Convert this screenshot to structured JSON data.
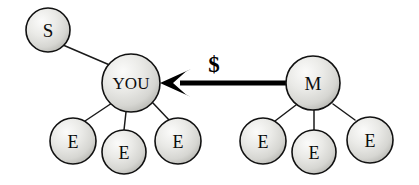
{
  "diagram": {
    "background_color": "#ffffff",
    "node_fill_light": "#f4f4f2",
    "node_fill_mid": "#dcdcd8",
    "node_fill_dark": "#b8b8b4",
    "node_stroke_color": "#111111",
    "edge_color": "#1a1a1a",
    "arrow_color": "#000000",
    "nodes": [
      {
        "id": "s",
        "label": "S",
        "cx": 48,
        "cy": 30,
        "r": 22,
        "font_size": 19
      },
      {
        "id": "you",
        "label": "YOU",
        "cx": 131,
        "cy": 83,
        "r": 29,
        "font_size": 17
      },
      {
        "id": "m",
        "label": "M",
        "cx": 313,
        "cy": 83,
        "r": 27,
        "font_size": 19
      },
      {
        "id": "e1",
        "label": "E",
        "cx": 73,
        "cy": 141,
        "r": 23,
        "font_size": 18
      },
      {
        "id": "e2",
        "label": "E",
        "cx": 124,
        "cy": 152,
        "r": 22,
        "font_size": 18
      },
      {
        "id": "e3",
        "label": "E",
        "cx": 178,
        "cy": 141,
        "r": 23,
        "font_size": 18
      },
      {
        "id": "e4",
        "label": "E",
        "cx": 263,
        "cy": 141,
        "r": 23,
        "font_size": 18
      },
      {
        "id": "e5",
        "label": "E",
        "cx": 314,
        "cy": 152,
        "r": 22,
        "font_size": 18
      },
      {
        "id": "e6",
        "label": "E",
        "cx": 370,
        "cy": 140,
        "r": 23,
        "font_size": 18
      }
    ],
    "edges": [
      {
        "id": "s-you",
        "from": "s",
        "to": "you",
        "x1": 63,
        "y1": 45,
        "x2": 112,
        "y2": 66
      },
      {
        "id": "you-e1",
        "from": "you",
        "to": "e1",
        "x1": 112,
        "y1": 103,
        "x2": 85,
        "y2": 121
      },
      {
        "id": "you-e2",
        "from": "you",
        "to": "e2",
        "x1": 126,
        "y1": 112,
        "x2": 124,
        "y2": 130
      },
      {
        "id": "you-e3",
        "from": "you",
        "to": "e3",
        "x1": 152,
        "y1": 102,
        "x2": 170,
        "y2": 121
      },
      {
        "id": "m-e4",
        "from": "m",
        "to": "e4",
        "x1": 296,
        "y1": 105,
        "x2": 275,
        "y2": 121
      },
      {
        "id": "m-e5",
        "from": "m",
        "to": "e5",
        "x1": 314,
        "y1": 110,
        "x2": 314,
        "y2": 130
      },
      {
        "id": "m-e6",
        "from": "m",
        "to": "e6",
        "x1": 333,
        "y1": 104,
        "x2": 355,
        "y2": 120
      }
    ],
    "money_arrow": {
      "id": "money-arrow",
      "label": "$",
      "label_x": 214,
      "label_y": 64,
      "label_font_size": 23,
      "direction": "right-to-left",
      "from_node": "m",
      "to_node": "you",
      "shaft_x1": 288,
      "shaft_x2": 180,
      "shaft_y": 83,
      "head_tip_x": 160,
      "head_tip_y": 83,
      "head_back_x": 191,
      "head_half_height": 14
    }
  }
}
